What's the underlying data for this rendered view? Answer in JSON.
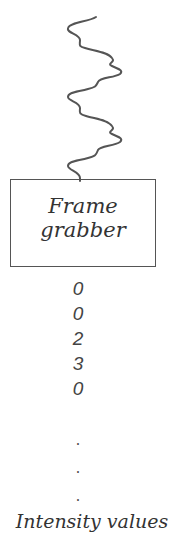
{
  "signal": {
    "icon": "wave-signal-icon"
  },
  "frame_grabber": {
    "line1": "Frame",
    "line2": "grabber"
  },
  "intensity_values": [
    "0",
    "0",
    "2",
    "3",
    "0"
  ],
  "ellipsis": [
    ".",
    ".",
    "."
  ],
  "caption": "Intensity values"
}
